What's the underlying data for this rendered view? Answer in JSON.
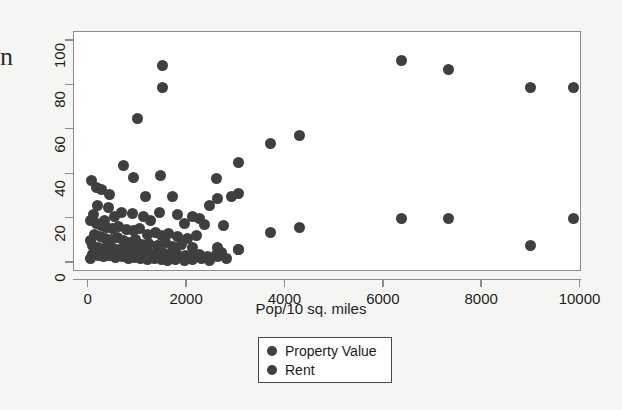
{
  "margin_text": "n",
  "chart_data": {
    "type": "scatter",
    "title": "",
    "xlabel": "Pop/10 sq. miles",
    "ylabel": "",
    "xlim": [
      -300,
      10030
    ],
    "ylim": [
      -4,
      104
    ],
    "xticks": [
      0,
      2000,
      4000,
      6000,
      8000,
      10000
    ],
    "xtick_labels": [
      "0",
      "2000",
      "4000",
      "6000",
      "8000",
      "10000"
    ],
    "yticks": [
      0,
      20,
      40,
      60,
      80,
      100
    ],
    "ytick_labels": [
      "0",
      "20",
      "40",
      "60",
      "80",
      "100"
    ],
    "grid": false,
    "legend_position": "below-center",
    "marker_color": "#3f3f3f",
    "legend": [
      "Property Value",
      "Rent"
    ],
    "series": [
      {
        "name": "Property Value",
        "color": "#3f3f3f",
        "points": [
          [
            1500,
            89
          ],
          [
            1500,
            79
          ],
          [
            1000,
            65
          ],
          [
            3700,
            54
          ],
          [
            4280,
            57.5
          ],
          [
            3050,
            45.5
          ],
          [
            6350,
            91
          ],
          [
            7320,
            87
          ],
          [
            8980,
            79
          ],
          [
            9850,
            79
          ],
          [
            700,
            44
          ],
          [
            900,
            38.5
          ],
          [
            1450,
            39.5
          ],
          [
            2600,
            38
          ],
          [
            60,
            37
          ],
          [
            150,
            34
          ],
          [
            250,
            33
          ],
          [
            430,
            31
          ],
          [
            1150,
            30
          ],
          [
            1700,
            30
          ],
          [
            2450,
            26
          ],
          [
            2620,
            29
          ],
          [
            2900,
            30
          ],
          [
            3050,
            31.5
          ],
          [
            1430,
            23
          ],
          [
            1800,
            22
          ],
          [
            2100,
            21
          ],
          [
            2260,
            20
          ],
          [
            660,
            23
          ],
          [
            880,
            22.5
          ],
          [
            1120,
            21
          ],
          [
            1250,
            19
          ],
          [
            400,
            25
          ],
          [
            520,
            21
          ],
          [
            180,
            26
          ],
          [
            90,
            22
          ],
          [
            320,
            19
          ],
          [
            1950,
            18
          ],
          [
            2350,
            17.5
          ],
          [
            2750,
            17
          ],
          [
            150,
            18
          ],
          [
            260,
            17
          ],
          [
            370,
            16
          ],
          [
            480,
            15.5
          ],
          [
            600,
            16.5
          ],
          [
            760,
            15
          ],
          [
            900,
            14.5
          ],
          [
            1040,
            15.5
          ],
          [
            1200,
            13
          ],
          [
            1350,
            14
          ],
          [
            1480,
            12.5
          ],
          [
            1620,
            13.5
          ],
          [
            1800,
            12
          ],
          [
            2000,
            11
          ],
          [
            2200,
            12.5
          ],
          [
            120,
            13
          ],
          [
            240,
            12
          ],
          [
            350,
            11
          ],
          [
            470,
            10.5
          ],
          [
            580,
            11.5
          ],
          [
            700,
            10
          ],
          [
            820,
            9.5
          ],
          [
            950,
            10.5
          ],
          [
            1080,
            8.5
          ],
          [
            1220,
            9
          ],
          [
            1400,
            8
          ],
          [
            1560,
            9.5
          ],
          [
            1700,
            7.5
          ],
          [
            1880,
            8.5
          ],
          [
            2100,
            7
          ],
          [
            80,
            8
          ],
          [
            200,
            7
          ],
          [
            320,
            6.5
          ],
          [
            440,
            7.5
          ],
          [
            560,
            6
          ],
          [
            690,
            6.5
          ],
          [
            810,
            5.5
          ],
          [
            940,
            6
          ],
          [
            1070,
            5
          ],
          [
            1200,
            5.5
          ],
          [
            1340,
            4.5
          ],
          [
            1490,
            5
          ],
          [
            1630,
            4
          ],
          [
            1790,
            4.5
          ],
          [
            1960,
            3.5
          ],
          [
            2130,
            4
          ],
          [
            70,
            4
          ],
          [
            190,
            3.5
          ],
          [
            310,
            3
          ],
          [
            430,
            3.5
          ],
          [
            550,
            2.5
          ],
          [
            680,
            3
          ],
          [
            800,
            2
          ],
          [
            930,
            2.5
          ],
          [
            1060,
            2
          ],
          [
            1190,
            1.5
          ],
          [
            1330,
            2
          ],
          [
            1470,
            1.5
          ],
          [
            1610,
            1
          ],
          [
            1770,
            1.5
          ],
          [
            1940,
            1
          ],
          [
            2110,
            1.5
          ],
          [
            2300,
            2
          ],
          [
            2460,
            1
          ],
          [
            2620,
            7
          ],
          [
            2700,
            5
          ],
          [
            3050,
            6
          ],
          [
            2620,
            3
          ],
          [
            2800,
            2
          ],
          [
            30,
            19
          ],
          [
            30,
            10
          ],
          [
            40,
            2
          ],
          [
            2260,
            4
          ],
          [
            2420,
            3
          ]
        ]
      },
      {
        "name": "Rent",
        "color": "#3f3f3f",
        "points": [
          [
            3700,
            14
          ],
          [
            4280,
            16
          ],
          [
            6350,
            20
          ],
          [
            7320,
            20
          ],
          [
            8980,
            8
          ],
          [
            9850,
            20
          ],
          [
            2600,
            4
          ],
          [
            3050,
            6
          ]
        ]
      }
    ]
  }
}
